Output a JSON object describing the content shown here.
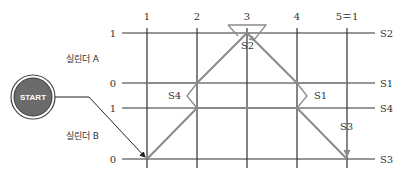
{
  "diagram": {
    "type": "displacement-step diagram",
    "start_button": {
      "label": "START",
      "fill": "#6b6b6b"
    },
    "steps": [
      "1",
      "2",
      "3",
      "4",
      "5＝1"
    ],
    "cylinders": [
      {
        "label": "실린더 A",
        "levels": [
          "1",
          "0"
        ],
        "signals": [
          "S2",
          "S1"
        ]
      },
      {
        "label": "실린더 B",
        "levels": [
          "1",
          "0"
        ],
        "signals": [
          "S4",
          "S3"
        ]
      }
    ],
    "annotations": {
      "s2": "S2",
      "s4": "S4",
      "s1": "S1",
      "s3": "S3"
    },
    "colors": {
      "grid": "#333333",
      "motion": "#8a8a8a"
    }
  }
}
